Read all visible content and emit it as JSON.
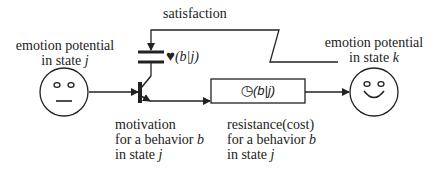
{
  "labels": {
    "satisfaction": "satisfaction",
    "emotion_left": {
      "line1": "emotion potential",
      "line2_prefix": "in state ",
      "var": "j"
    },
    "emotion_right": {
      "line1": "emotion potential",
      "line2_prefix": "in state ",
      "var": "k"
    },
    "motivation": {
      "line1": "motivation",
      "line2_prefix": "for a behavior ",
      "line2_var": "b",
      "line3_prefix": "in state ",
      "line3_var": "j"
    },
    "resistance": {
      "line1": "resistance(cost)",
      "line2_prefix": "for a behavior ",
      "line2_var": "b",
      "line3_prefix": "in state ",
      "line3_var": "j"
    },
    "heart_symbol": "♥",
    "heart_expr": "(b|j)",
    "clock_symbol": "◷",
    "clock_expr": "(b|j)"
  },
  "colors": {
    "stroke": "#222222",
    "background": "#ffffff"
  }
}
